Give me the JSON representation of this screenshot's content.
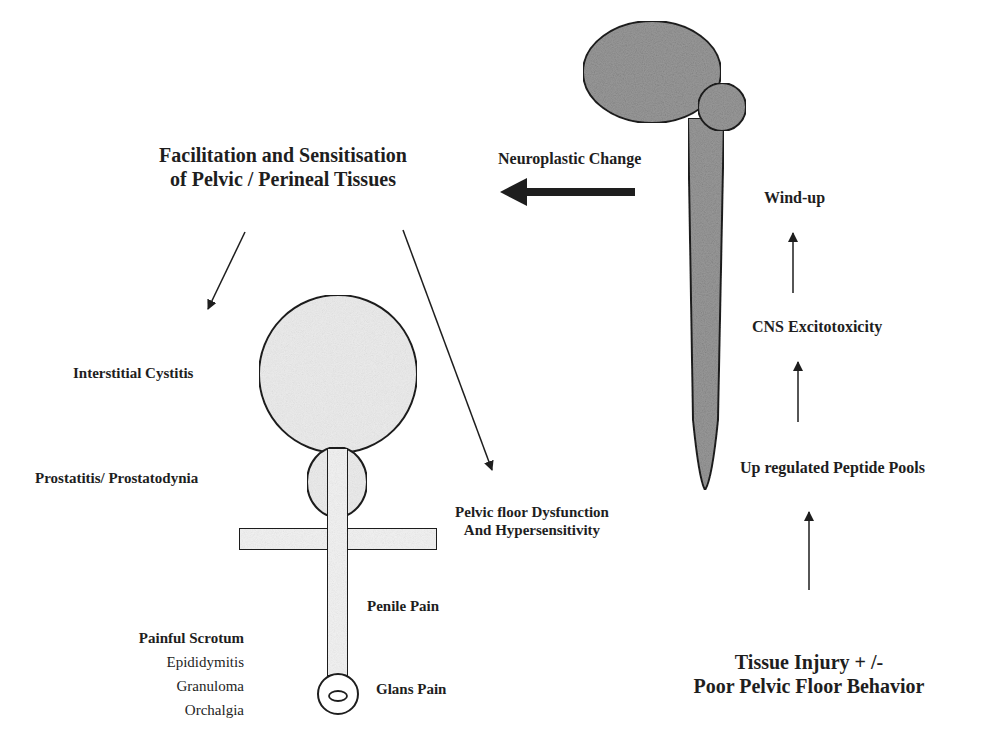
{
  "diagram": {
    "colors": {
      "ink": "#1e1e1e",
      "cns_fill": "#9a9a9a",
      "pelvic_fill": "#ececec",
      "background": "#ffffff"
    },
    "top_label": {
      "line1": "Facilitation and Sensitisation",
      "line2": "of Pelvic / Perineal Tissues"
    },
    "neuroplastic_label": "Neuroplastic Change",
    "cns_cascade": [
      {
        "label": "Wind-up"
      },
      {
        "label": "CNS Excitotoxicity"
      },
      {
        "label": "Up regulated Peptide Pools"
      }
    ],
    "origin_label": {
      "line1": "Tissue Injury + /-",
      "line2": "Poor Pelvic Floor Behavior"
    },
    "pelvic_labels": {
      "bladder": "Interstitial Cystitis",
      "prostate": "Prostatitis/ Prostatodynia",
      "pelvic_floor_line1": "Pelvic floor Dysfunction",
      "pelvic_floor_line2": "And Hypersensitivity",
      "penile": "Penile Pain",
      "glans": "Glans Pain"
    },
    "scrotum": {
      "title": "Painful Scrotum",
      "items": [
        "Epididymitis",
        "Granuloma",
        "Orchalgia"
      ]
    },
    "icons": {
      "brain": "brain-icon",
      "spinal_cord": "spinal-cord-icon",
      "bladder": "bladder-icon",
      "prostate": "prostate-icon",
      "pelvic_floor": "pelvic-floor-icon",
      "penis": "penis-icon"
    }
  }
}
